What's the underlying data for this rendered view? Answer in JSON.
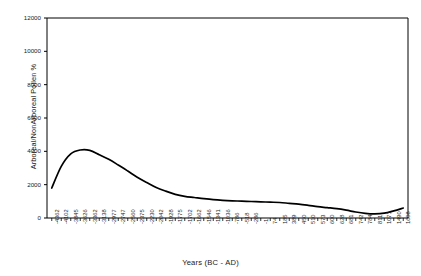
{
  "chart_data": {
    "type": "line",
    "title": "",
    "xlabel": "Years (BC - AD)",
    "ylabel": "Arboreal/NonArboreal Pollen %",
    "ylim": [
      0,
      12000
    ],
    "yticks": [
      0,
      2000,
      4000,
      6000,
      8000,
      10000,
      12000
    ],
    "ytick_labels": [
      "0",
      "2000",
      "4000",
      "6000",
      "8000",
      "10000",
      "12000"
    ],
    "grid": false,
    "legend": "none",
    "categories": [
      "-4362",
      "-4102",
      "-3845",
      "-3626",
      "-3362",
      "-3138",
      "-2977",
      "-2747",
      "-2560",
      "-2375",
      "-2230",
      "-2042",
      "-1928",
      "-1775",
      "-1702",
      "-1662",
      "-1546",
      "-1341",
      "-1036",
      "-786",
      "-518",
      "-286",
      "-1",
      "74",
      "185",
      "389",
      "450",
      "510",
      "573",
      "600",
      "628",
      "681",
      "742",
      "784",
      "811",
      "1071",
      "1490",
      "1608"
    ],
    "values": [
      1800,
      3100,
      3850,
      4080,
      4060,
      3800,
      3520,
      3180,
      2820,
      2450,
      2130,
      1830,
      1610,
      1420,
      1300,
      1230,
      1160,
      1100,
      1060,
      1030,
      1010,
      990,
      970,
      950,
      930,
      880,
      830,
      760,
      680,
      620,
      560,
      470,
      360,
      280,
      250,
      290,
      430,
      600
    ]
  }
}
